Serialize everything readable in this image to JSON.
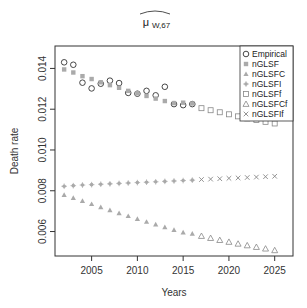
{
  "chart_data": {
    "type": "scatter",
    "title_main": "μ",
    "title_sub": "W,67",
    "xlabel": "Years",
    "ylabel": "Death rate",
    "xlim": [
      2001,
      2027
    ],
    "ylim": [
      0.0048,
      0.0151
    ],
    "xticks": [
      2005,
      2010,
      2015,
      2020,
      2025
    ],
    "yticks": [
      0.006,
      0.008,
      0.01,
      0.012,
      0.014
    ],
    "ytick_labels": [
      "0.006",
      "0.008",
      "0.010",
      "0.012",
      "0.014"
    ],
    "grid": false,
    "legend_position": "top-right",
    "series": [
      {
        "name": "Empirical",
        "marker": "circle-open",
        "color": "#333333",
        "x": [
          2002,
          2003,
          2004,
          2005,
          2006,
          2007,
          2008,
          2009,
          2010,
          2011,
          2012,
          2013,
          2014,
          2015,
          2016
        ],
        "values": [
          0.0143,
          0.01418,
          0.0133,
          0.01302,
          0.01325,
          0.0134,
          0.01328,
          0.0128,
          0.01276,
          0.0129,
          0.01268,
          0.0131,
          0.01225,
          0.0122,
          0.01225
        ]
      },
      {
        "name": "nGLSF",
        "marker": "square-filled",
        "color": "#aaaaaa",
        "x": [
          2002,
          2003,
          2004,
          2005,
          2006,
          2007,
          2008,
          2009,
          2010,
          2011,
          2012,
          2013,
          2014,
          2015,
          2016
        ],
        "values": [
          0.01395,
          0.0138,
          0.01362,
          0.01348,
          0.01332,
          0.01318,
          0.01305,
          0.0129,
          0.01278,
          0.01265,
          0.01252,
          0.0124,
          0.0123,
          0.01232,
          0.01228
        ]
      },
      {
        "name": "nGLSFC",
        "marker": "triangle-filled",
        "color": "#aaaaaa",
        "x": [
          2002,
          2003,
          2004,
          2005,
          2006,
          2007,
          2008,
          2009,
          2010,
          2011,
          2012,
          2013,
          2014,
          2015,
          2016
        ],
        "values": [
          0.0078,
          0.00765,
          0.0075,
          0.00735,
          0.0072,
          0.00705,
          0.0069,
          0.00676,
          0.00662,
          0.00648,
          0.00635,
          0.00622,
          0.00608,
          0.00596,
          0.0059
        ]
      },
      {
        "name": "nGLSFI",
        "marker": "plus-filled",
        "color": "#aaaaaa",
        "x": [
          2002,
          2003,
          2004,
          2005,
          2006,
          2007,
          2008,
          2009,
          2010,
          2011,
          2012,
          2013,
          2014,
          2015,
          2016
        ],
        "values": [
          0.00822,
          0.00825,
          0.00828,
          0.0083,
          0.00832,
          0.00834,
          0.00836,
          0.00838,
          0.0084,
          0.00842,
          0.00844,
          0.00846,
          0.00848,
          0.0085,
          0.00852
        ]
      },
      {
        "name": "nGLSFf",
        "marker": "square-open",
        "color": "#888888",
        "x": [
          2017,
          2018,
          2019,
          2020,
          2021,
          2022,
          2023,
          2024,
          2025
        ],
        "values": [
          0.01205,
          0.01195,
          0.01185,
          0.01175,
          0.01165,
          0.01155,
          0.01147,
          0.01138,
          0.0113
        ]
      },
      {
        "name": "nGLSFCf",
        "marker": "triangle-open",
        "color": "#888888",
        "x": [
          2017,
          2018,
          2019,
          2020,
          2021,
          2022,
          2023,
          2024,
          2025
        ],
        "values": [
          0.00578,
          0.00568,
          0.00558,
          0.00549,
          0.0054,
          0.00532,
          0.00524,
          0.00516,
          0.00508
        ]
      },
      {
        "name": "nGLSFIf",
        "marker": "cross",
        "color": "#888888",
        "x": [
          2017,
          2018,
          2019,
          2020,
          2021,
          2022,
          2023,
          2024,
          2025
        ],
        "values": [
          0.00855,
          0.00857,
          0.00859,
          0.00861,
          0.00863,
          0.00865,
          0.00867,
          0.00869,
          0.00871
        ]
      }
    ]
  }
}
